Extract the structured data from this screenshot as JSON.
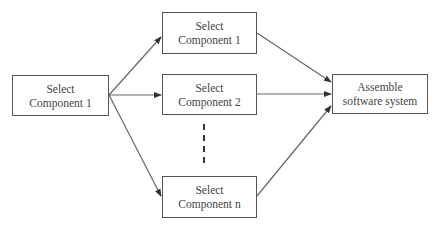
{
  "diagram": {
    "nodes": [
      {
        "id": "left",
        "line1": "Select",
        "line2": "Component 1"
      },
      {
        "id": "top",
        "line1": "Select",
        "line2": "Component 1"
      },
      {
        "id": "middle",
        "line1": "Select",
        "line2": "Component 2"
      },
      {
        "id": "bottom",
        "line1": "Select",
        "line2": "Component n"
      },
      {
        "id": "right",
        "line1": "Assemble",
        "line2": "software system"
      }
    ],
    "edges": [
      {
        "from": "left",
        "to": "top"
      },
      {
        "from": "left",
        "to": "middle"
      },
      {
        "from": "left",
        "to": "bottom"
      },
      {
        "from": "top",
        "to": "right"
      },
      {
        "from": "middle",
        "to": "right"
      },
      {
        "from": "bottom",
        "to": "right"
      }
    ],
    "ellipsis": "dashed vertical line between middle and bottom",
    "colors": {
      "stroke": "#555555",
      "text": "#444444",
      "background": "#ffffff"
    }
  }
}
